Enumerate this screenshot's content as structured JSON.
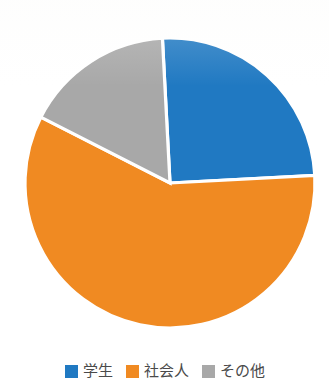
{
  "chart_data": {
    "type": "pie",
    "title": "",
    "subtitle": "",
    "xlabel": "",
    "ylabel": "",
    "legend_position": "bottom",
    "grid": false,
    "categories": [
      "学生",
      "社会人",
      "その他"
    ],
    "values": [
      25,
      64,
      11
    ],
    "unit": "%",
    "colors": [
      "#2079C2",
      "#F08A22",
      "#A8A8A8"
    ],
    "slices": [
      {
        "label": "学生",
        "value": 25,
        "color": "#2079C2",
        "start_angle": 357,
        "end_angle": 447
      },
      {
        "label": "社会人",
        "value": 64,
        "color": "#F08A22",
        "start_angle": 447,
        "end_angle": 657
      },
      {
        "label": "その他",
        "value": 11,
        "color": "#A8A8A8",
        "start_angle": 657,
        "end_angle": 717
      }
    ],
    "geometry": {
      "center_x": 170,
      "center_y": 183,
      "radius": 145
    }
  },
  "legend": {
    "items": [
      {
        "label": "学生",
        "color": "#2079C2"
      },
      {
        "label": "社会人",
        "color": "#F08A22"
      },
      {
        "label": "その他",
        "color": "#A8A8A8"
      }
    ]
  },
  "colors": {
    "background": "#FFFFFF",
    "slice_border": "#FFFFFF",
    "legend_text": "#4A4A4A",
    "title_text": "#3A3A3A"
  }
}
